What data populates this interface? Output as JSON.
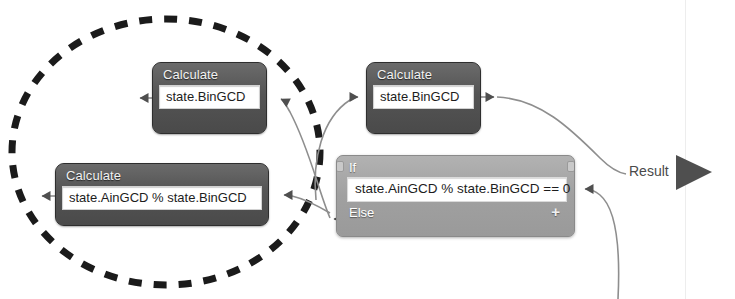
{
  "diagram": {
    "nodes": [
      {
        "id": "calc-bingcd-top",
        "type": "Calculate",
        "title": "Calculate",
        "expression": "state.BinGCD",
        "x": 152,
        "y": 62,
        "w": 115,
        "h": 72
      },
      {
        "id": "calc-bingcd-right",
        "type": "Calculate",
        "title": "Calculate",
        "expression": "state.BinGCD",
        "x": 366,
        "y": 62,
        "w": 115,
        "h": 72
      },
      {
        "id": "calc-mod",
        "type": "Calculate",
        "title": "Calculate",
        "expression": "state.AinGCD % state.BinGCD",
        "x": 55,
        "y": 163,
        "w": 214,
        "h": 63
      }
    ],
    "if_node": {
      "id": "if-condition",
      "if_label": "If",
      "condition": "state.AinGCD % state.BinGCD == 0",
      "else_label": "Else",
      "add_branch_label": "+",
      "x": 336,
      "y": 155,
      "w": 239,
      "h": 82
    },
    "result": {
      "label": "Result",
      "x": 629,
      "y": 163
    },
    "highlight": {
      "shape": "dashed-ellipse",
      "cx": 166,
      "cy": 152,
      "rx": 154,
      "ry": 133,
      "color": "#1b1b1b",
      "dash": "14 11",
      "width": 7
    },
    "colors": {
      "node_fill": "#575757",
      "node_border": "#2e2e2e",
      "if_fill": "#a3a3a3",
      "if_border": "#8a8a8a",
      "field_fill": "#ffffff",
      "field_text": "#1d1d1d",
      "title_text": "#f2f2f2",
      "wire": "#8e8e8e",
      "arrow": "#4f4f4f",
      "result_text": "#4a4a4a",
      "canvas": "#ffffff"
    },
    "wires": [
      {
        "id": "wire-top-out-left",
        "from": "calc-bingcd-top",
        "to": "offscreen-left"
      },
      {
        "id": "wire-top-in-right",
        "from": "if-else-out",
        "to": "calc-bingcd-top"
      },
      {
        "id": "wire-right-in",
        "from": "if-else-out",
        "to": "calc-bingcd-right"
      },
      {
        "id": "wire-right-out",
        "from": "calc-bingcd-right",
        "to": "result"
      },
      {
        "id": "wire-mod-out-left",
        "from": "calc-mod",
        "to": "offscreen-left"
      },
      {
        "id": "wire-mod-in",
        "from": "if-else-out",
        "to": "calc-mod"
      },
      {
        "id": "wire-if-cond-in",
        "from": "loop-back",
        "to": "if-condition"
      }
    ],
    "divider": {
      "x": 685
    }
  }
}
